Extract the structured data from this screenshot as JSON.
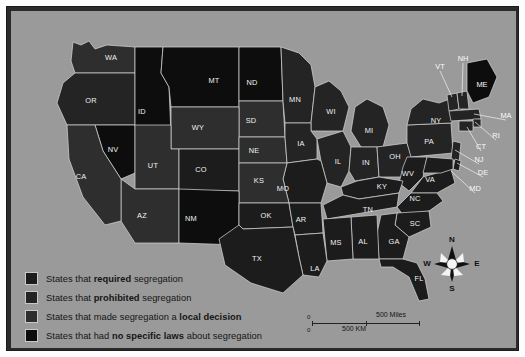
{
  "figure": {
    "kind": "thematic-map"
  },
  "colors": {
    "page_background": "#fdfdfd",
    "frame": "#2a2a2a",
    "map_background": "#9a9a9a",
    "required": "#1c1c1c",
    "prohibited": "#242424",
    "local_decision": "#2e2e2e",
    "no_specific_laws": "#0d0d0d",
    "state_border": "#cfcfcf",
    "label_text": "#f2f2f2"
  },
  "legend": {
    "items": [
      {
        "swatch": "required",
        "color": "#1c1c1c",
        "pre": "States that ",
        "strong": "required",
        "post": " segregation"
      },
      {
        "swatch": "prohibited",
        "color": "#242424",
        "pre": "States that ",
        "strong": "prohibited",
        "post": " segregation"
      },
      {
        "swatch": "local_decision",
        "color": "#2e2e2e",
        "pre": "States that made segregation a ",
        "strong": "local decision",
        "post": ""
      },
      {
        "swatch": "no_specific_laws",
        "color": "#0d0d0d",
        "pre": "States that had ",
        "strong": "no specific laws",
        "post": " about segregation"
      }
    ]
  },
  "scale_bar": {
    "miles": {
      "zero": "0",
      "max": "500 Miles"
    },
    "km": {
      "zero": "0",
      "max": "500 KM"
    }
  },
  "compass": {
    "north": "N",
    "south": "S",
    "east": "E",
    "west": "W"
  },
  "map": {
    "states_inside": [
      {
        "code": "WA",
        "x": 100,
        "y": 47,
        "cat": "local_decision"
      },
      {
        "code": "OR",
        "x": 80,
        "y": 90,
        "cat": "prohibited"
      },
      {
        "code": "ID",
        "x": 131,
        "y": 101,
        "cat": "no_specific_laws"
      },
      {
        "code": "MT",
        "x": 203,
        "y": 70,
        "cat": "no_specific_laws"
      },
      {
        "code": "ND",
        "x": 241,
        "y": 72,
        "cat": "no_specific_laws"
      },
      {
        "code": "MN",
        "x": 284,
        "y": 89,
        "cat": "prohibited"
      },
      {
        "code": "WI",
        "x": 320,
        "y": 101,
        "cat": "prohibited"
      },
      {
        "code": "MI",
        "x": 358,
        "y": 120,
        "cat": "prohibited"
      },
      {
        "code": "SD",
        "x": 240,
        "y": 110,
        "cat": "local_decision"
      },
      {
        "code": "WY",
        "x": 187,
        "y": 117,
        "cat": "local_decision"
      },
      {
        "code": "NV",
        "x": 102,
        "y": 139,
        "cat": "no_specific_laws"
      },
      {
        "code": "CA",
        "x": 70,
        "y": 166,
        "cat": "local_decision"
      },
      {
        "code": "UT",
        "x": 142,
        "y": 155,
        "cat": "local_decision"
      },
      {
        "code": "CO",
        "x": 190,
        "y": 159,
        "cat": "required"
      },
      {
        "code": "NE",
        "x": 243,
        "y": 140,
        "cat": "local_decision"
      },
      {
        "code": "IA",
        "x": 290,
        "y": 133,
        "cat": "prohibited"
      },
      {
        "code": "IL",
        "x": 327,
        "y": 151,
        "cat": "prohibited"
      },
      {
        "code": "IN",
        "x": 355,
        "y": 152,
        "cat": "prohibited"
      },
      {
        "code": "OH",
        "x": 384,
        "y": 146,
        "cat": "prohibited"
      },
      {
        "code": "PA",
        "x": 418,
        "y": 131,
        "cat": "prohibited"
      },
      {
        "code": "NY",
        "x": 425,
        "y": 110,
        "cat": "prohibited"
      },
      {
        "code": "WV",
        "x": 397,
        "y": 163,
        "cat": "required"
      },
      {
        "code": "VA",
        "x": 419,
        "y": 169,
        "cat": "required"
      },
      {
        "code": "KY",
        "x": 371,
        "y": 176,
        "cat": "required"
      },
      {
        "code": "MO",
        "x": 272,
        "y": 178,
        "cat": "required"
      },
      {
        "code": "KS",
        "x": 248,
        "y": 170,
        "cat": "local_decision"
      },
      {
        "code": "AZ",
        "x": 131,
        "y": 205,
        "cat": "local_decision"
      },
      {
        "code": "NM",
        "x": 180,
        "y": 208,
        "cat": "no_specific_laws"
      },
      {
        "code": "OK",
        "x": 255,
        "y": 205,
        "cat": "required"
      },
      {
        "code": "AR",
        "x": 290,
        "y": 209,
        "cat": "required"
      },
      {
        "code": "TN",
        "x": 357,
        "y": 199,
        "cat": "required"
      },
      {
        "code": "NC",
        "x": 404,
        "y": 188,
        "cat": "required"
      },
      {
        "code": "SC",
        "x": 404,
        "y": 213,
        "cat": "required"
      },
      {
        "code": "GA",
        "x": 383,
        "y": 231,
        "cat": "required"
      },
      {
        "code": "AL",
        "x": 352,
        "y": 231,
        "cat": "required"
      },
      {
        "code": "MS",
        "x": 325,
        "y": 232,
        "cat": "required"
      },
      {
        "code": "LA",
        "x": 304,
        "y": 258,
        "cat": "required"
      },
      {
        "code": "TX",
        "x": 246,
        "y": 248,
        "cat": "required"
      },
      {
        "code": "FL",
        "x": 408,
        "y": 268,
        "cat": "required"
      }
    ],
    "states_outside": [
      {
        "code": "VT",
        "x": 429,
        "y": 56,
        "lx": 441,
        "ly": 86
      },
      {
        "code": "NH",
        "x": 452,
        "y": 48,
        "lx": 451,
        "ly": 85
      },
      {
        "code": "ME",
        "x": 471,
        "y": 74,
        "lx": 471,
        "ly": 74
      },
      {
        "code": "MA",
        "x": 495,
        "y": 105,
        "lx": 463,
        "ly": 103
      },
      {
        "code": "RI",
        "x": 485,
        "y": 125,
        "lx": 464,
        "ly": 111
      },
      {
        "code": "CT",
        "x": 470,
        "y": 136,
        "lx": 456,
        "ly": 116
      },
      {
        "code": "NJ",
        "x": 468,
        "y": 149,
        "lx": 444,
        "ly": 139
      },
      {
        "code": "DE",
        "x": 472,
        "y": 162,
        "lx": 446,
        "ly": 152
      },
      {
        "code": "MD",
        "x": 464,
        "y": 178,
        "lx": 440,
        "ly": 160
      }
    ]
  }
}
